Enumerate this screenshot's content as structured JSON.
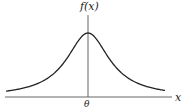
{
  "diagram": {
    "type": "density-curve",
    "labels": {
      "y_axis": "f(x)",
      "x_axis": "x",
      "center": "θ"
    },
    "colors": {
      "curve": "#222222",
      "axes": "#555555",
      "background": "#ffffff"
    }
  },
  "chart_data": {
    "type": "line",
    "title": "",
    "xlabel": "x",
    "ylabel": "f(x)",
    "x_ticks": [
      "θ"
    ],
    "series": [
      {
        "name": "f(x)",
        "x": [
          -4,
          -3,
          -2,
          -1.5,
          -1,
          -0.5,
          0,
          0.5,
          1,
          1.5,
          2,
          3,
          4
        ],
        "values": [
          0.019,
          0.032,
          0.064,
          0.098,
          0.159,
          0.255,
          0.318,
          0.255,
          0.159,
          0.098,
          0.064,
          0.032,
          0.019
        ]
      }
    ],
    "grid": false,
    "legend": "none"
  }
}
